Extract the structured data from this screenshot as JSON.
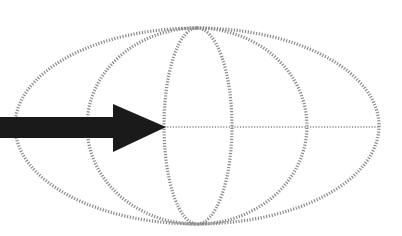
{
  "diagram": {
    "type": "map-projection-graticule",
    "colors": {
      "background": "#ffffff",
      "graticule": "#8a8a8a",
      "arrow": "#1a1a1a"
    },
    "ellipse": {
      "cx": 197,
      "cy": 126,
      "rx": 183,
      "ry": 99
    },
    "meridians": [
      {
        "name": "left-outer-inner",
        "rx": 112
      },
      {
        "name": "center-left",
        "rx": 34
      },
      {
        "name": "center-right",
        "rx": 34
      },
      {
        "name": "right-inner",
        "rx": 112
      }
    ],
    "equator": {
      "y": 127
    },
    "arrow": {
      "from_x": 0,
      "to_x": 166,
      "y": 127,
      "pointing_to": "central meridian"
    }
  }
}
